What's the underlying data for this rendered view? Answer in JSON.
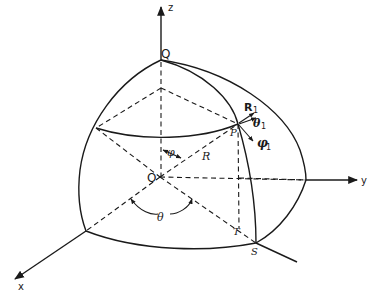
{
  "diagram": {
    "type": "spherical-coordinates-octant",
    "axes": {
      "z": {
        "label": "z"
      },
      "y": {
        "label": "y"
      },
      "x": {
        "label": "x"
      }
    },
    "points": {
      "origin": {
        "label": "O"
      },
      "Q": {
        "label": "Q"
      },
      "P": {
        "label": "P"
      },
      "S": {
        "label": "S"
      },
      "T": {
        "label": "T"
      }
    },
    "quantities": {
      "radius": {
        "label": "R"
      },
      "polar_angle": {
        "label": "φ"
      },
      "azimuth_angle": {
        "label": "θ"
      }
    },
    "unit_vectors": [
      {
        "symbol": "R",
        "subscript": "1"
      },
      {
        "symbol": "θ",
        "subscript": "1"
      },
      {
        "symbol": "φ",
        "subscript": "1"
      }
    ],
    "colors": {
      "ink": "#1a1a1a",
      "background": "#ffffff"
    }
  }
}
